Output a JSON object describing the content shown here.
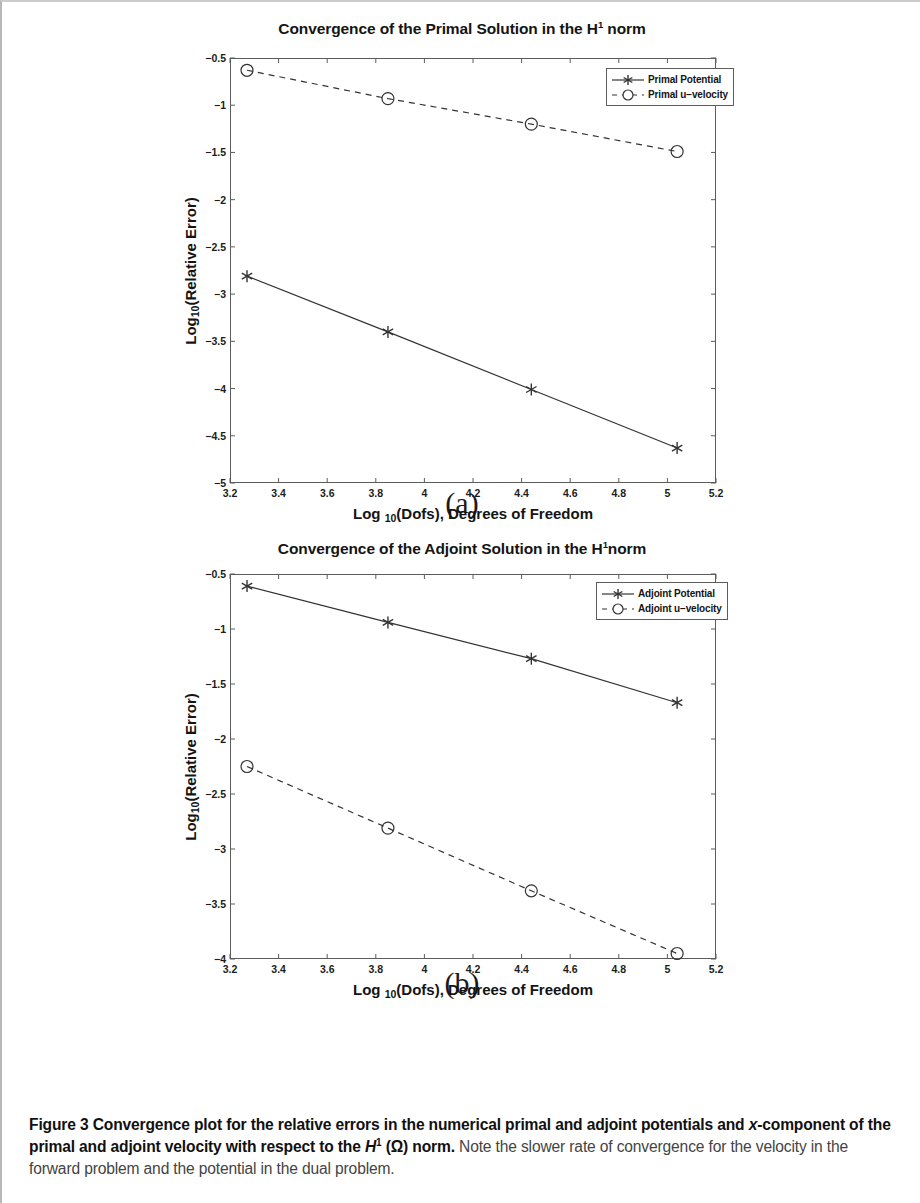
{
  "figure": {
    "caption_bold": "Figure 3 Convergence plot for the relative errors in the numerical primal and adjoint potentials and x-component of the primal and adjoint velocity with respect to the H1 (Ω) norm.",
    "caption_label": "Figure 3",
    "caption_bold_part1": "Convergence plot for the relative errors in the numerical primal and adjoint potentials and ",
    "caption_bold_italic_x": "x",
    "caption_bold_part2": "-component of the primal and adjoint velocity with respect to the ",
    "caption_bold_H": "H",
    "caption_bold_sup": "1",
    "caption_bold_part3": " (Ω) norm.",
    "caption_rest": " Note the slower rate of convergence for the velocity in the forward problem and the potential in the dual problem.",
    "subfigure_a": "(a)",
    "subfigure_b": "(b)"
  },
  "chart_data": [
    {
      "type": "line",
      "id": "primal",
      "title": "Convergence of the Primal Solution in the H1 norm",
      "title_prefix": "Convergence of the Primal Solution in the H",
      "title_sup": "1",
      "title_suffix": " norm",
      "xlabel_prefix": "Log",
      "xlabel_sub": "10",
      "xlabel_suffix": "(Dofs), Degrees of Freedom",
      "ylabel_prefix": "Log",
      "ylabel_sub": "10",
      "ylabel_suffix": "(Relative Error)",
      "xlim": [
        3.2,
        5.2
      ],
      "ylim": [
        -5,
        -0.5
      ],
      "xticks": [
        3.2,
        3.4,
        3.6,
        3.8,
        4,
        4.2,
        4.4,
        4.6,
        4.8,
        5,
        5.2
      ],
      "xticklabels": [
        "3.2",
        "3.4",
        "3.6",
        "3.8",
        "4",
        "4.2",
        "4.4",
        "4.6",
        "4.8",
        "5",
        "5.2"
      ],
      "yticks": [
        -5,
        -4.5,
        -4,
        -3.5,
        -3,
        -2.5,
        -2,
        -1.5,
        -1,
        -0.5
      ],
      "yticklabels": [
        "−5",
        "−4.5",
        "−4",
        "−3.5",
        "−3",
        "−2.5",
        "−2",
        "−1.5",
        "−1",
        "−0.5"
      ],
      "grid": false,
      "legend_position": "upper right",
      "series": [
        {
          "name": "Primal Potential",
          "marker": "asterisk",
          "linestyle": "solid",
          "color": "#333333",
          "x": [
            3.27,
            3.85,
            4.44,
            5.04
          ],
          "values": [
            -2.81,
            -3.4,
            -4.01,
            -4.63
          ]
        },
        {
          "name": "Primal u−velocity",
          "marker": "circle",
          "linestyle": "dashed",
          "color": "#333333",
          "x": [
            3.27,
            3.85,
            4.44,
            5.04
          ],
          "values": [
            -0.63,
            -0.93,
            -1.2,
            -1.49
          ]
        }
      ]
    },
    {
      "type": "line",
      "id": "adjoint",
      "title": "Convergence of the Adjoint Solution in the H1 norm",
      "title_prefix": "Convergence of the Adjoint Solution in the H",
      "title_sup": "1",
      "title_suffix": "norm",
      "xlabel_prefix": "Log",
      "xlabel_sub": "10",
      "xlabel_suffix": "(Dofs), Degrees of Freedom",
      "ylabel_prefix": "Log",
      "ylabel_sub": "10",
      "ylabel_suffix": "(Relative Error)",
      "xlim": [
        3.2,
        5.2
      ],
      "ylim": [
        -4,
        -0.5
      ],
      "xticks": [
        3.2,
        3.4,
        3.6,
        3.8,
        4,
        4.2,
        4.4,
        4.6,
        4.8,
        5,
        5.2
      ],
      "xticklabels": [
        "3.2",
        "3.4",
        "3.6",
        "3.8",
        "4",
        "4.2",
        "4.4",
        "4.6",
        "4.8",
        "5",
        "5.2"
      ],
      "yticks": [
        -4,
        -3.5,
        -3,
        -2.5,
        -2,
        -1.5,
        -1,
        -0.5
      ],
      "yticklabels": [
        "−4",
        "−3.5",
        "−3",
        "−2.5",
        "−2",
        "−1.5",
        "−1",
        "−0.5"
      ],
      "grid": false,
      "legend_position": "upper right",
      "series": [
        {
          "name": "Adjoint Potential",
          "marker": "asterisk",
          "linestyle": "solid",
          "color": "#333333",
          "x": [
            3.27,
            3.85,
            4.44,
            5.04
          ],
          "values": [
            -0.61,
            -0.94,
            -1.27,
            -1.67
          ]
        },
        {
          "name": "Adjoint u−velocity",
          "marker": "circle",
          "linestyle": "dashed",
          "color": "#333333",
          "x": [
            3.27,
            3.85,
            4.44,
            5.04
          ],
          "values": [
            -2.25,
            -2.81,
            -3.38,
            -3.95
          ]
        }
      ]
    }
  ]
}
